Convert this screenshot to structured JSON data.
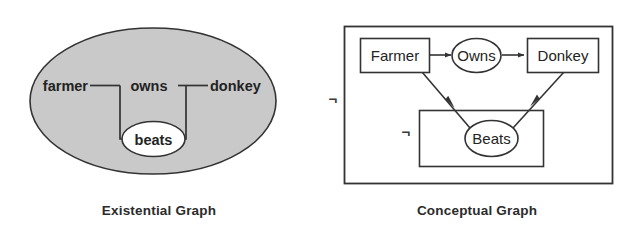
{
  "figure": {
    "panels": [
      {
        "id": "existential-graph",
        "caption": "Existential Graph",
        "outer_oval_label": "",
        "nodes": [
          {
            "id": "farmer",
            "label": "farmer",
            "shape": "text"
          },
          {
            "id": "owns",
            "label": "owns",
            "shape": "text"
          },
          {
            "id": "donkey",
            "label": "donkey",
            "shape": "text"
          },
          {
            "id": "beats",
            "label": "beats",
            "shape": "oval"
          }
        ],
        "edges": [
          {
            "from": "farmer",
            "to": "owns",
            "style": "line"
          },
          {
            "from": "owns",
            "to": "donkey",
            "style": "line"
          },
          {
            "from": "farmer",
            "to": "beats",
            "style": "line"
          },
          {
            "from": "donkey",
            "to": "beats",
            "style": "line"
          }
        ],
        "shading": "#c9c9c9",
        "stroke": "#333333"
      },
      {
        "id": "conceptual-graph",
        "caption": "Conceptual Graph",
        "negation_symbols": [
          "¬",
          "¬"
        ],
        "nodes": [
          {
            "id": "farmer",
            "label": "Farmer",
            "shape": "rect"
          },
          {
            "id": "owns",
            "label": "Owns",
            "shape": "oval"
          },
          {
            "id": "donkey",
            "label": "Donkey",
            "shape": "rect"
          },
          {
            "id": "beats",
            "label": "Beats",
            "shape": "oval"
          }
        ],
        "edges": [
          {
            "from": "farmer",
            "to": "owns",
            "style": "arrow"
          },
          {
            "from": "owns",
            "to": "donkey",
            "style": "arrow"
          },
          {
            "from": "farmer",
            "to": "beats",
            "style": "arrow"
          },
          {
            "from": "beats",
            "to": "donkey",
            "style": "arrow"
          }
        ],
        "stroke": "#333333",
        "fill": "#ffffff"
      }
    ]
  },
  "colors": {
    "page_background": "#ffffff",
    "oval_shading": "#c9c9c9",
    "line": "#333333",
    "text": "#232323",
    "caption_text": "#2b2b2b"
  }
}
